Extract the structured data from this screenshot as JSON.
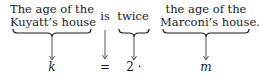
{
  "diagram": {
    "phrases": [
      {
        "line1": "The age of the",
        "line2": "Kuyatt’s house",
        "underbrace": true
      },
      {
        "line1": "is",
        "underbrace": false
      },
      {
        "line1": "twice",
        "underbrace": true
      },
      {
        "line1": "the age of the",
        "line2": "Marconi’s house.",
        "underbrace": true
      }
    ],
    "symbols": [
      "k",
      "=",
      "2 ·",
      "m"
    ]
  }
}
